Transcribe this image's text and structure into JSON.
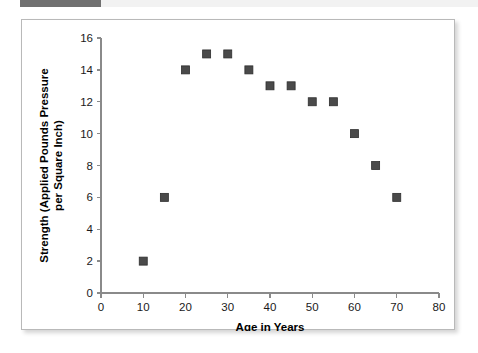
{
  "accent": {
    "bar_color": "#707070",
    "strip_color": "#f2f2f2"
  },
  "figure": {
    "background": "#ffffff",
    "border_color": "#b9b9b9"
  },
  "chart_data": {
    "type": "scatter",
    "title": "",
    "xlabel": "Age in Years",
    "ylabel": "Strength (Applied Pounds Pressure per Square Inch)",
    "ylabel_line1": "Strength (Applied Pounds Pressure",
    "ylabel_line2": "per Square Inch)",
    "xlim": [
      0,
      80
    ],
    "ylim": [
      0,
      16
    ],
    "xticks": [
      0,
      10,
      20,
      30,
      40,
      50,
      60,
      70,
      80
    ],
    "yticks": [
      0,
      2,
      4,
      6,
      8,
      10,
      12,
      14,
      16
    ],
    "xtick_labels": [
      "0",
      "10",
      "20",
      "30",
      "40",
      "50",
      "60",
      "70",
      "80"
    ],
    "ytick_labels": [
      "0",
      "2",
      "4",
      "6",
      "8",
      "10",
      "12",
      "14",
      "16"
    ],
    "grid": false,
    "legend": null,
    "marker": {
      "shape": "square",
      "color": "#4a4a4a",
      "edge_color": "#2e2e2e",
      "size_px": 8
    },
    "x": [
      10,
      15,
      20,
      25,
      30,
      35,
      40,
      45,
      50,
      55,
      60,
      65,
      70
    ],
    "y": [
      2,
      6,
      14,
      15,
      15,
      14,
      13,
      13,
      12,
      12,
      10,
      8,
      6
    ],
    "points": [
      {
        "x": 10,
        "y": 2
      },
      {
        "x": 15,
        "y": 6
      },
      {
        "x": 20,
        "y": 14
      },
      {
        "x": 25,
        "y": 15
      },
      {
        "x": 30,
        "y": 15
      },
      {
        "x": 35,
        "y": 14
      },
      {
        "x": 40,
        "y": 13
      },
      {
        "x": 45,
        "y": 13
      },
      {
        "x": 50,
        "y": 12
      },
      {
        "x": 55,
        "y": 12
      },
      {
        "x": 60,
        "y": 10
      },
      {
        "x": 65,
        "y": 8
      },
      {
        "x": 70,
        "y": 6
      }
    ]
  }
}
